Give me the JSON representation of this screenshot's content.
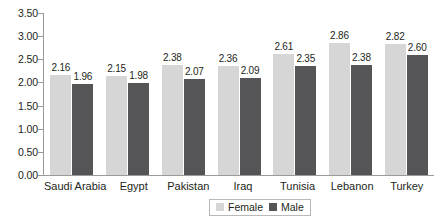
{
  "chart_data": {
    "type": "bar",
    "title": "",
    "subtitle": "",
    "xlabel": "",
    "ylabel": "",
    "ylim": [
      0.0,
      3.5
    ],
    "ytick_labels": [
      "3.50",
      "3.00",
      "2.50",
      "2.00",
      "1.50",
      "1.00",
      "0.50",
      "0.00"
    ],
    "ytick_values": [
      3.5,
      3.0,
      2.5,
      2.0,
      1.5,
      1.0,
      0.5,
      0.0
    ],
    "grid": false,
    "legend_position": "bottom",
    "categories": [
      "Saudi Arabia",
      "Egypt",
      "Pakistan",
      "Iraq",
      "Tunisia",
      "Lebanon",
      "Turkey"
    ],
    "series": [
      {
        "name": "Female",
        "color": "#d6d6d6",
        "values": [
          2.16,
          2.15,
          2.38,
          2.36,
          2.61,
          2.86,
          2.82
        ],
        "labels": [
          "2.16",
          "2.15",
          "2.38",
          "2.36",
          "2.61",
          "2.86",
          "2.82"
        ]
      },
      {
        "name": "Male",
        "color": "#555557",
        "values": [
          1.96,
          1.98,
          2.07,
          2.09,
          2.35,
          2.38,
          2.6
        ],
        "labels": [
          "1.96",
          "1.98",
          "2.07",
          "2.09",
          "2.35",
          "2.38",
          "2.60"
        ]
      }
    ]
  }
}
